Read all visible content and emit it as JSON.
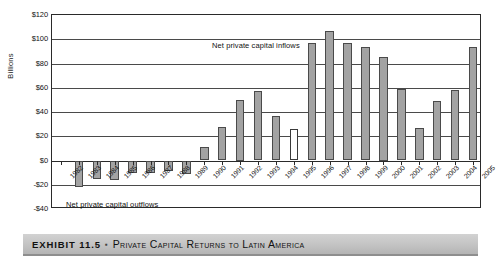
{
  "chart_data": {
    "type": "bar",
    "title": "Private Capital Returns to Latin America",
    "xlabel": "",
    "ylabel": "Billions",
    "ylim": [
      -40,
      120
    ],
    "ytick_step": 20,
    "ytick_labels": [
      "$120",
      "$100",
      "$80",
      "$60",
      "$40",
      "$20",
      "$0",
      "-$20",
      "-$40"
    ],
    "ytick_values": [
      120,
      100,
      80,
      60,
      40,
      20,
      0,
      -20,
      -40
    ],
    "grid": "horizontal",
    "legend": "none",
    "categories": [
      "1982",
      "1983",
      "1984",
      "1985",
      "1986",
      "1987",
      "1988",
      "1989",
      "1990",
      "1991",
      "1992",
      "1993",
      "1994",
      "1995",
      "1996",
      "1997",
      "1998",
      "1999",
      "2000",
      "2001",
      "2002",
      "2003",
      "2004",
      "2005"
    ],
    "values": [
      0,
      -22,
      -15,
      -16,
      -10,
      -10,
      -9,
      -11,
      11,
      28,
      50,
      57,
      37,
      26,
      97,
      107,
      97,
      94,
      85,
      59,
      27,
      49,
      58,
      94
    ],
    "bar_styles": [
      "filled",
      "filled",
      "filled",
      "filled",
      "filled",
      "filled",
      "filled",
      "filled",
      "filled",
      "filled",
      "filled",
      "filled",
      "filled",
      "hollow",
      "filled",
      "filled",
      "filled",
      "filled",
      "filled",
      "filled",
      "filled",
      "filled",
      "filled",
      "filled"
    ],
    "annotations": [
      {
        "id": "inflows",
        "text": "Net private capital inflows"
      },
      {
        "id": "outflows",
        "text": "Net private capital outflows"
      }
    ],
    "colors": {
      "bar_fill": "#a3a3a3",
      "bar_stroke": "#4a4a4a",
      "hollow_fill": "#ffffff",
      "gridline": "#4a4a4a",
      "axis": "#2a2a2a",
      "caption_bar": "#c3c3c3",
      "text": "#111111"
    }
  },
  "caption": {
    "exhibit_label": "EXHIBIT 11.5",
    "separator": "▪",
    "title": "Private Capital Returns to Latin America"
  }
}
